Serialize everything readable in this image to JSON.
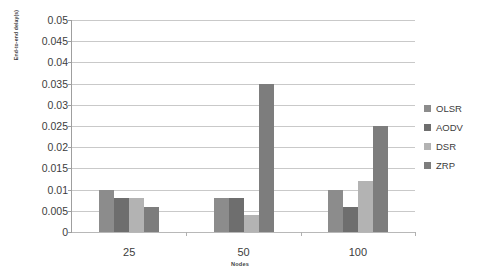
{
  "chart_data": {
    "type": "bar",
    "title": "",
    "xlabel": "Nodes",
    "ylabel": "End-to-end delay(s)",
    "categories": [
      "25",
      "50",
      "100"
    ],
    "series": [
      {
        "name": "OLSR",
        "color": "#8c8c8c",
        "values": [
          0.01,
          0.008,
          0.01
        ]
      },
      {
        "name": "AODV",
        "color": "#6e6e6e",
        "values": [
          0.008,
          0.008,
          0.006
        ]
      },
      {
        "name": "DSR",
        "color": "#b3b3b3",
        "values": [
          0.008,
          0.004,
          0.012
        ]
      },
      {
        "name": "ZRP",
        "color": "#7d7d7d",
        "values": [
          0.006,
          0.035,
          0.025
        ]
      }
    ],
    "ylim": [
      0,
      0.05
    ],
    "ytick_step": 0.005,
    "yticks": [
      "0",
      "0.005",
      "0.01",
      "0.015",
      "0.02",
      "0.025",
      "0.03",
      "0.035",
      "0.04",
      "0.045",
      "0.05"
    ],
    "grid": true,
    "legend_position": "right",
    "background_color": "#ffffff",
    "gridline_color": "#c9c9c9",
    "axis_color": "#9f9f9f"
  }
}
